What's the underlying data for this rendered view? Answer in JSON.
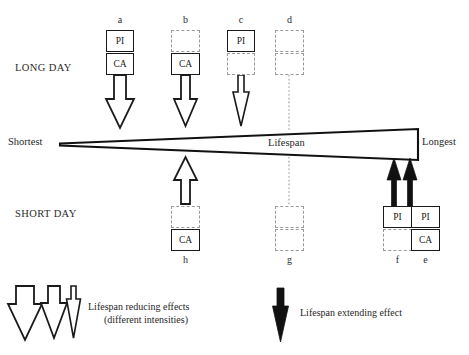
{
  "figure": {
    "title_text": "Lifespan",
    "axis": {
      "left_label": "Shortest",
      "right_label": "Longest",
      "center_label": "Lifespan"
    },
    "row_labels": {
      "top": "LONG DAY",
      "bottom": "SHORT DAY"
    },
    "colors": {
      "stroke": "#1a1a1a",
      "dashed_stroke": "#9a9a9a",
      "fill_white": "#ffffff",
      "fill_black": "#111111",
      "background": "#ffffff",
      "text": "#262626"
    },
    "top_columns": [
      {
        "letter": "a",
        "top_box": {
          "label": "PI",
          "style": "solid"
        },
        "bottom_box": {
          "label": "CA",
          "style": "solid"
        },
        "arrow": {
          "direction": "down",
          "style": "outline",
          "intensity": "wide"
        }
      },
      {
        "letter": "b",
        "top_box": {
          "label": "",
          "style": "dashed"
        },
        "bottom_box": {
          "label": "CA",
          "style": "solid"
        },
        "arrow": {
          "direction": "down",
          "style": "outline",
          "intensity": "medium"
        }
      },
      {
        "letter": "c",
        "top_box": {
          "label": "PI",
          "style": "solid"
        },
        "bottom_box": {
          "label": "",
          "style": "dashed"
        },
        "arrow": {
          "direction": "down",
          "style": "outline",
          "intensity": "narrow"
        }
      },
      {
        "letter": "d",
        "top_box": {
          "label": "",
          "style": "dashed"
        },
        "bottom_box": {
          "label": "",
          "style": "dashed"
        },
        "arrow": {
          "direction": "none",
          "style": "dotted-line",
          "intensity": "none"
        }
      }
    ],
    "bottom_columns": [
      {
        "letter": "h",
        "top_box": {
          "label": "",
          "style": "dashed"
        },
        "bottom_box": {
          "label": "CA",
          "style": "solid"
        },
        "arrow": {
          "direction": "up",
          "style": "outline",
          "intensity": "medium"
        }
      },
      {
        "letter": "g",
        "top_box": {
          "label": "",
          "style": "dashed"
        },
        "bottom_box": {
          "label": "",
          "style": "dashed"
        },
        "arrow": {
          "direction": "none",
          "style": "dotted-line",
          "intensity": "none"
        }
      },
      {
        "letter": "f",
        "top_box": {
          "label": "PI",
          "style": "solid"
        },
        "bottom_box": {
          "label": "",
          "style": "dashed"
        },
        "arrow": {
          "direction": "up",
          "style": "filled",
          "intensity": "narrow"
        }
      },
      {
        "letter": "e",
        "top_box": {
          "label": "PI",
          "style": "solid"
        },
        "bottom_box": {
          "label": "CA",
          "style": "solid"
        },
        "arrow": {
          "direction": "up",
          "style": "filled",
          "intensity": "narrow"
        }
      }
    ],
    "legend": {
      "reducing": {
        "line1": "Lifespan reducing effects",
        "line2": "(different intensities)",
        "arrow_count": 3,
        "arrow_style": "outline",
        "arrow_direction": "down"
      },
      "extending": {
        "line1": "Lifespan extending effect",
        "arrow_count": 1,
        "arrow_style": "filled",
        "arrow_direction": "down"
      }
    }
  }
}
